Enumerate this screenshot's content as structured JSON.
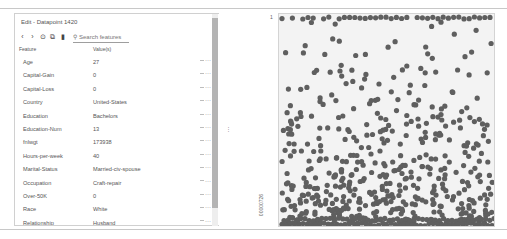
{
  "editor": {
    "title": "Edit - Datapoint 1420",
    "toolbar": {
      "icons": [
        "chevron-left-icon",
        "chevron-right-icon",
        "history-icon",
        "copy-icon",
        "delete-icon"
      ],
      "glyphs": [
        "‹",
        "›",
        "⊙",
        "⧉",
        "▮"
      ],
      "search_placeholder": "Search features",
      "search_glyph": "⚲"
    },
    "columns": {
      "feature": "Feature",
      "value": "Value(s)"
    },
    "rows": [
      {
        "feature": "Age",
        "value": "27",
        "menu": "···"
      },
      {
        "feature": "Capital-Gain",
        "value": "0",
        "menu": "···"
      },
      {
        "feature": "Capital-Loss",
        "value": "0",
        "menu": "···"
      },
      {
        "feature": "Country",
        "value": "United-States",
        "menu": "···"
      },
      {
        "feature": "Education",
        "value": "Bachelors",
        "menu": "···"
      },
      {
        "feature": "Education-Num",
        "value": "13",
        "menu": "···"
      },
      {
        "feature": "fnlwgt",
        "value": "173938",
        "menu": "···"
      },
      {
        "feature": "Hours-per-week",
        "value": "40",
        "menu": "···"
      },
      {
        "feature": "Marital-Status",
        "value": "Married-civ-spouse",
        "menu": "···"
      },
      {
        "feature": "Occupation",
        "value": "Craft-repair",
        "menu": "···"
      },
      {
        "feature": "Over-50K",
        "value": "0",
        "menu": "···"
      },
      {
        "feature": "Race",
        "value": "White",
        "menu": "···"
      },
      {
        "feature": "Relationship",
        "value": "Husband",
        "menu": "···"
      }
    ]
  },
  "divider": {
    "handle": "⋮"
  },
  "plot": {
    "y_top_label": "1",
    "y_bottom_label": "00000726",
    "dot_color": "#5f5f5f",
    "background": "#f3f3f3"
  }
}
